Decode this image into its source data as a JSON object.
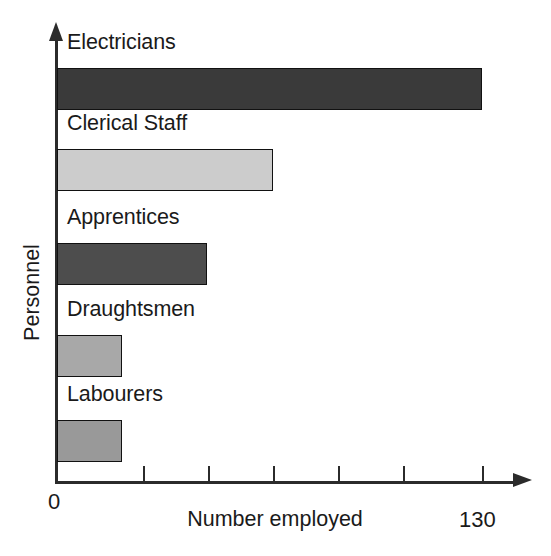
{
  "chart_data": {
    "type": "bar",
    "orientation": "horizontal",
    "title": "",
    "xlabel": "Number employed",
    "ylabel": "Personnel",
    "categories": [
      "Electricians",
      "Clerical Staff",
      "Apprentices",
      "Draughtsmen",
      "Labourers"
    ],
    "values": [
      130,
      66,
      46,
      20,
      20
    ],
    "xlim": [
      0,
      143
    ],
    "xticks": [
      0,
      26,
      52,
      78,
      104,
      130
    ],
    "xtick_labels": [
      "0",
      "",
      "",
      "",
      "",
      "130"
    ],
    "grid": false,
    "legend": false,
    "bar_colors": [
      "#3a3a3a",
      "#cccccc",
      "#4d4d4d",
      "#a8a8a8",
      "#999999"
    ]
  },
  "axes": {
    "x_title": "Number employed",
    "y_title": "Personnel",
    "x_min_label": "0",
    "x_max_label": "130"
  },
  "bars": [
    {
      "label": "Electricians",
      "value": 130,
      "color": "#3a3a3a",
      "border": "#111111"
    },
    {
      "label": "Clerical Staff",
      "value": 66,
      "color": "#cccccc",
      "border": "#111111"
    },
    {
      "label": "Apprentices",
      "value": 46,
      "color": "#4d4d4d",
      "border": "#111111"
    },
    {
      "label": "Draughtsmen",
      "value": 20,
      "color": "#a8a8a8",
      "border": "#111111"
    },
    {
      "label": "Labourers",
      "value": 20,
      "color": "#999999",
      "border": "#111111"
    }
  ],
  "geometry": {
    "origin_x": 57,
    "baseline_y": 481,
    "px_per_unit": 3.2692,
    "bar_tops": [
      68,
      149,
      243,
      335,
      420
    ],
    "bar_height": 42,
    "label_tops": [
      32,
      113,
      207,
      299,
      384
    ],
    "tick_xs": [
      143,
      208,
      273,
      338,
      403,
      482
    ]
  }
}
